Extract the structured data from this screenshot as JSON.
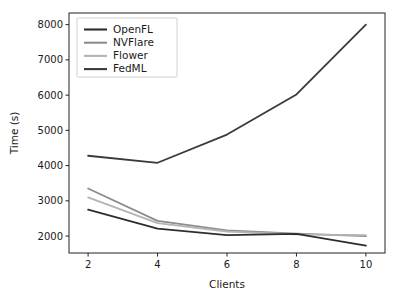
{
  "chart_data": {
    "type": "line",
    "title": "",
    "xlabel": "Clients",
    "ylabel": "Time (s)",
    "x": [
      2,
      4,
      6,
      8,
      10
    ],
    "xticks": [
      "2",
      "4",
      "6",
      "8",
      "10"
    ],
    "yticks": [
      "2000",
      "3000",
      "4000",
      "5000",
      "6000",
      "7000",
      "8000"
    ],
    "xlim": [
      1.45,
      10.55
    ],
    "ylim": [
      1520,
      8330
    ],
    "grid": false,
    "legend_position": "upper left",
    "series": [
      {
        "name": "OpenFL",
        "color": "#2d2d2d",
        "values": [
          2750,
          2210,
          2030,
          2060,
          1730
        ]
      },
      {
        "name": "NVFlare",
        "color": "#8c8c8c",
        "values": [
          3350,
          2430,
          2160,
          2070,
          2000
        ]
      },
      {
        "name": "Flower",
        "color": "#b4b4b4",
        "values": [
          3100,
          2370,
          2130,
          2050,
          2030
        ]
      },
      {
        "name": "FedML",
        "color": "#3a3a3a",
        "values": [
          4280,
          4080,
          4880,
          6020,
          8000
        ]
      }
    ]
  },
  "legend": {
    "entries": [
      {
        "label": "OpenFL"
      },
      {
        "label": "NVFlare"
      },
      {
        "label": "Flower"
      },
      {
        "label": "FedML"
      }
    ]
  },
  "axes": {
    "x_title": "Clients",
    "y_title": "Time (s)",
    "x_tick_labels": [
      "2",
      "4",
      "6",
      "8",
      "10"
    ],
    "y_tick_labels": [
      "2000",
      "3000",
      "4000",
      "5000",
      "6000",
      "7000",
      "8000"
    ]
  }
}
